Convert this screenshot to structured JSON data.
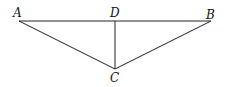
{
  "diagram": {
    "points": {
      "A": {
        "label": "A",
        "x": 19,
        "y": 21
      },
      "B": {
        "label": "B",
        "x": 211,
        "y": 21
      },
      "C": {
        "label": "C",
        "x": 115,
        "y": 69
      },
      "D": {
        "label": "D",
        "x": 115,
        "y": 21
      }
    },
    "segments": [
      "AB",
      "AC",
      "BC",
      "DC"
    ],
    "line_color": "#222222"
  }
}
